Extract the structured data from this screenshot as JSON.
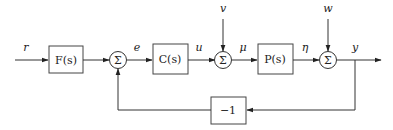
{
  "diagram": {
    "type": "control-block-diagram",
    "signals": {
      "r": "r",
      "e": "e",
      "u": "u",
      "mu": "μ",
      "eta": "η",
      "y": "y",
      "v": "v",
      "w": "w"
    },
    "blocks": {
      "F": "F(s)",
      "C": "C(s)",
      "P": "P(s)",
      "feedback": "−1"
    },
    "summing_junctions": {
      "sum1": "Σ",
      "sum2": "Σ",
      "sum3": "Σ"
    }
  }
}
